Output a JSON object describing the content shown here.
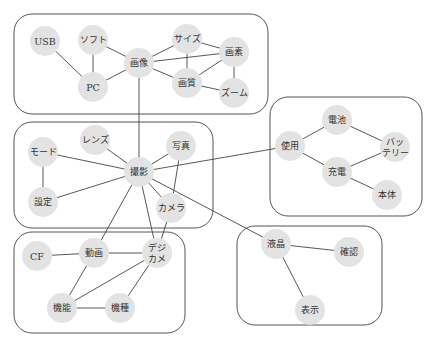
{
  "diagram": {
    "type": "co-occurrence network",
    "clusters": [
      {
        "id": "c1",
        "x": 14,
        "y": 14,
        "w": 254,
        "h": 100
      },
      {
        "id": "c2",
        "x": 14,
        "y": 122,
        "w": 199,
        "h": 106
      },
      {
        "id": "c3",
        "x": 270,
        "y": 97,
        "w": 152,
        "h": 119
      },
      {
        "id": "c4",
        "x": 14,
        "y": 232,
        "w": 171,
        "h": 101
      },
      {
        "id": "c5",
        "x": 237,
        "y": 226,
        "w": 145,
        "h": 99
      }
    ],
    "nodes": [
      {
        "id": "usb",
        "label": "USB",
        "x": 45,
        "y": 41,
        "r": 15,
        "cluster": "c1"
      },
      {
        "id": "soft",
        "label": "ソフト",
        "x": 93,
        "y": 40,
        "r": 15,
        "cluster": "c1"
      },
      {
        "id": "gazou",
        "label": "画像",
        "x": 139,
        "y": 63,
        "r": 15,
        "cluster": "c1"
      },
      {
        "id": "pc",
        "label": "PC",
        "x": 93,
        "y": 87,
        "r": 15,
        "cluster": "c1"
      },
      {
        "id": "size",
        "label": "サイズ",
        "x": 187,
        "y": 39,
        "r": 15,
        "cluster": "c1"
      },
      {
        "id": "gaso",
        "label": "画素",
        "x": 234,
        "y": 52,
        "r": 15,
        "cluster": "c1"
      },
      {
        "id": "gashitsu",
        "label": "画質",
        "x": 187,
        "y": 83,
        "r": 15,
        "cluster": "c1"
      },
      {
        "id": "zoom",
        "label": "ズーム",
        "x": 234,
        "y": 93,
        "r": 15,
        "cluster": "c1"
      },
      {
        "id": "lens",
        "label": "レンズ",
        "x": 95,
        "y": 140,
        "r": 15,
        "cluster": "c2"
      },
      {
        "id": "shashin",
        "label": "写真",
        "x": 181,
        "y": 146,
        "r": 15,
        "cluster": "c2"
      },
      {
        "id": "mode",
        "label": "モード",
        "x": 43,
        "y": 152,
        "r": 15,
        "cluster": "c2"
      },
      {
        "id": "satsuei",
        "label": "撮影",
        "x": 139,
        "y": 172,
        "r": 15,
        "cluster": "c2"
      },
      {
        "id": "settei",
        "label": "設定",
        "x": 43,
        "y": 202,
        "r": 15,
        "cluster": "c2"
      },
      {
        "id": "camera",
        "label": "カメラ",
        "x": 171,
        "y": 208,
        "r": 15,
        "cluster": "c2"
      },
      {
        "id": "denchi",
        "label": "電池",
        "x": 337,
        "y": 120,
        "r": 15,
        "cluster": "c3"
      },
      {
        "id": "shiyou",
        "label": "使用",
        "x": 290,
        "y": 146,
        "r": 15,
        "cluster": "c3"
      },
      {
        "id": "battery",
        "label": "バッ\nテリー",
        "label_lines": [
          "バッ",
          "テリー"
        ],
        "x": 395,
        "y": 147,
        "r": 15,
        "cluster": "c3"
      },
      {
        "id": "juuden",
        "label": "充電",
        "x": 337,
        "y": 172,
        "r": 15,
        "cluster": "c3"
      },
      {
        "id": "hontai",
        "label": "本体",
        "x": 387,
        "y": 195,
        "r": 15,
        "cluster": "c3"
      },
      {
        "id": "cf",
        "label": "CF",
        "x": 37,
        "y": 256,
        "r": 15,
        "cluster": "c4"
      },
      {
        "id": "douga",
        "label": "動画",
        "x": 94,
        "y": 253,
        "r": 15,
        "cluster": "c4"
      },
      {
        "id": "digicame",
        "label": "デジ\nカメ",
        "label_lines": [
          "デジ",
          "カメ"
        ],
        "x": 157,
        "y": 253,
        "r": 15,
        "cluster": "c4"
      },
      {
        "id": "kinou",
        "label": "機能",
        "x": 62,
        "y": 308,
        "r": 15,
        "cluster": "c4"
      },
      {
        "id": "kishu",
        "label": "機種",
        "x": 120,
        "y": 308,
        "r": 15,
        "cluster": "c4"
      },
      {
        "id": "ekishou",
        "label": "液晶",
        "x": 276,
        "y": 244,
        "r": 15,
        "cluster": "c5"
      },
      {
        "id": "kakunin",
        "label": "確認",
        "x": 349,
        "y": 252,
        "r": 15,
        "cluster": "c5"
      },
      {
        "id": "hyouji",
        "label": "表示",
        "x": 310,
        "y": 310,
        "r": 15,
        "cluster": "c5"
      }
    ],
    "edges": [
      [
        "usb",
        "pc"
      ],
      [
        "soft",
        "pc"
      ],
      [
        "soft",
        "gazou"
      ],
      [
        "pc",
        "gazou"
      ],
      [
        "gazou",
        "size"
      ],
      [
        "gazou",
        "gaso"
      ],
      [
        "gazou",
        "gashitsu"
      ],
      [
        "size",
        "gaso"
      ],
      [
        "size",
        "gashitsu"
      ],
      [
        "gaso",
        "gashitsu"
      ],
      [
        "gaso",
        "zoom"
      ],
      [
        "gashitsu",
        "zoom"
      ],
      [
        "gazou",
        "satsuei"
      ],
      [
        "lens",
        "satsuei"
      ],
      [
        "shashin",
        "satsuei"
      ],
      [
        "mode",
        "satsuei"
      ],
      [
        "mode",
        "settei"
      ],
      [
        "settei",
        "satsuei"
      ],
      [
        "satsuei",
        "camera"
      ],
      [
        "shashin",
        "camera"
      ],
      [
        "satsuei",
        "shiyou"
      ],
      [
        "satsuei",
        "ekishou"
      ],
      [
        "satsuei",
        "douga"
      ],
      [
        "satsuei",
        "digicame"
      ],
      [
        "camera",
        "digicame"
      ],
      [
        "shiyou",
        "denchi"
      ],
      [
        "denchi",
        "battery"
      ],
      [
        "shiyou",
        "juuden"
      ],
      [
        "juuden",
        "battery"
      ],
      [
        "juuden",
        "hontai"
      ],
      [
        "cf",
        "douga"
      ],
      [
        "douga",
        "digicame"
      ],
      [
        "douga",
        "kinou"
      ],
      [
        "digicame",
        "kinou"
      ],
      [
        "digicame",
        "kishu"
      ],
      [
        "kinou",
        "kishu"
      ],
      [
        "ekishou",
        "kakunin"
      ],
      [
        "ekishou",
        "hyouji"
      ]
    ],
    "colors": {
      "node_fill": "#e3e3e3",
      "edge": "#444444",
      "cluster_border": "#555555",
      "label": "#333333",
      "background": "#ffffff"
    }
  }
}
